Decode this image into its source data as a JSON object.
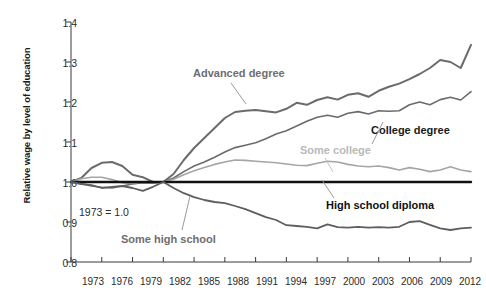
{
  "chart_data": {
    "type": "line",
    "title": "",
    "xlabel": "",
    "ylabel": "Relative wage by level of education",
    "note": "1973 = 1.0",
    "xlim": [
      1973,
      2012
    ],
    "ylim": [
      0.8,
      1.4
    ],
    "grid": false,
    "legend_position": "inline-annotations",
    "ytick_labels": [
      "1.4",
      "1.3",
      "1.2",
      "1.1",
      "1.0",
      "0.9",
      "0.8"
    ],
    "ytick_values": [
      1.4,
      1.3,
      1.2,
      1.1,
      1.0,
      0.9,
      0.8
    ],
    "xtick_labels": [
      "1973",
      "1976",
      "1979",
      "1982",
      "1985",
      "1988",
      "1991",
      "1994",
      "1997",
      "2000",
      "2003",
      "2006",
      "2009",
      "2012"
    ],
    "xtick_values": [
      1973,
      1976,
      1979,
      1982,
      1985,
      1988,
      1991,
      1994,
      1997,
      2000,
      2003,
      2006,
      2009,
      2012
    ],
    "x": [
      1973,
      1974,
      1975,
      1976,
      1977,
      1978,
      1979,
      1980,
      1981,
      1982,
      1983,
      1984,
      1985,
      1986,
      1987,
      1988,
      1989,
      1990,
      1991,
      1992,
      1993,
      1994,
      1995,
      1996,
      1997,
      1998,
      1999,
      2000,
      2001,
      2002,
      2003,
      2004,
      2005,
      2006,
      2007,
      2008,
      2009,
      2010,
      2011,
      2012
    ],
    "series": [
      {
        "name": "Advanced degree",
        "color": "#6b6b6b",
        "width": 2.0,
        "values": [
          1.0,
          1.01,
          1.035,
          1.048,
          1.05,
          1.04,
          1.018,
          1.012,
          1.0,
          1.0,
          1.02,
          1.055,
          1.085,
          1.11,
          1.135,
          1.16,
          1.175,
          1.178,
          1.18,
          1.177,
          1.174,
          1.183,
          1.198,
          1.193,
          1.205,
          1.212,
          1.206,
          1.218,
          1.222,
          1.213,
          1.228,
          1.238,
          1.246,
          1.257,
          1.27,
          1.285,
          1.305,
          1.3,
          1.285,
          1.343
        ]
      },
      {
        "name": "College degree",
        "color": "#6b6b6b",
        "width": 1.6,
        "values": [
          1.0,
          0.996,
          0.99,
          0.987,
          0.985,
          0.99,
          0.995,
          0.998,
          0.997,
          1.0,
          1.01,
          1.026,
          1.04,
          1.05,
          1.062,
          1.075,
          1.086,
          1.092,
          1.098,
          1.108,
          1.12,
          1.128,
          1.14,
          1.152,
          1.162,
          1.167,
          1.162,
          1.172,
          1.176,
          1.17,
          1.178,
          1.177,
          1.178,
          1.193,
          1.2,
          1.193,
          1.206,
          1.212,
          1.205,
          1.226
        ]
      },
      {
        "name": "Some college",
        "color": "#a5a5a5",
        "width": 1.6,
        "values": [
          1.0,
          1.008,
          1.012,
          1.012,
          1.006,
          0.998,
          0.996,
          1.0,
          0.998,
          1.0,
          1.007,
          1.018,
          1.028,
          1.036,
          1.044,
          1.05,
          1.055,
          1.054,
          1.052,
          1.05,
          1.048,
          1.045,
          1.042,
          1.041,
          1.047,
          1.052,
          1.05,
          1.044,
          1.04,
          1.038,
          1.04,
          1.036,
          1.03,
          1.036,
          1.032,
          1.026,
          1.03,
          1.038,
          1.03,
          1.026
        ]
      },
      {
        "name": "High school diploma",
        "color": "#111111",
        "width": 2.4,
        "values": [
          1.0,
          1.0,
          1.0,
          1.0,
          1.0,
          1.0,
          1.0,
          1.0,
          1.0,
          1.0,
          1.0,
          1.0,
          1.0,
          1.0,
          1.0,
          1.0,
          1.0,
          1.0,
          1.0,
          1.0,
          1.0,
          1.0,
          1.0,
          1.0,
          1.0,
          1.0,
          1.0,
          1.0,
          1.0,
          1.0,
          1.0,
          1.0,
          1.0,
          1.0,
          1.0,
          1.0,
          1.0,
          1.0,
          1.0,
          1.0
        ]
      },
      {
        "name": "Some high school",
        "color": "#5e5e5e",
        "width": 1.8,
        "values": [
          1.0,
          0.995,
          0.992,
          0.985,
          0.988,
          0.99,
          0.985,
          0.978,
          0.988,
          1.0,
          0.985,
          0.972,
          0.962,
          0.955,
          0.95,
          0.947,
          0.94,
          0.932,
          0.922,
          0.912,
          0.905,
          0.892,
          0.89,
          0.888,
          0.884,
          0.894,
          0.887,
          0.886,
          0.888,
          0.886,
          0.887,
          0.886,
          0.888,
          0.9,
          0.902,
          0.893,
          0.884,
          0.88,
          0.884,
          0.886
        ]
      }
    ],
    "annotations": [
      {
        "id": "advanced",
        "text": "Advanced degree"
      },
      {
        "id": "college",
        "text": "College degree"
      },
      {
        "id": "some_college",
        "text": "Some college"
      },
      {
        "id": "hs_diploma",
        "text": "High school diploma"
      },
      {
        "id": "some_hs",
        "text": "Some high school"
      }
    ]
  }
}
